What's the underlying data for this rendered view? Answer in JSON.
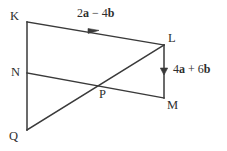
{
  "diagram": {
    "type": "vector-geometry-figure",
    "background_color": "#ffffff",
    "stroke_color": "#3a3a3a",
    "text_color": "#2e2e2e",
    "vertices": [
      {
        "id": "K",
        "label": "K",
        "x": 27,
        "y": 22
      },
      {
        "id": "L",
        "label": "L",
        "x": 164,
        "y": 45
      },
      {
        "id": "N",
        "label": "N",
        "x": 27,
        "y": 73
      },
      {
        "id": "M",
        "label": "M",
        "x": 164,
        "y": 98
      },
      {
        "id": "P",
        "label": "P",
        "x": 102,
        "y": 87
      },
      {
        "id": "Q",
        "label": "Q",
        "x": 27,
        "y": 130
      }
    ],
    "segments": [
      {
        "id": "KL",
        "from": "K",
        "to": "L",
        "arrow": "mid-forward"
      },
      {
        "id": "KQ",
        "from": "K",
        "to": "Q",
        "arrow": "none"
      },
      {
        "id": "LM",
        "from": "L",
        "to": "M",
        "arrow": "mid-down"
      },
      {
        "id": "NM",
        "from": "N",
        "to": "M",
        "arrow": "none"
      },
      {
        "id": "QL",
        "from": "Q",
        "to": "L",
        "arrow": "none"
      }
    ],
    "vector_labels": {
      "kl": {
        "coefficient_a": "2",
        "a": "a",
        "operator": " − ",
        "coefficient_b": "4",
        "b": "b"
      },
      "lm": {
        "coefficient_a": "4",
        "a": "a",
        "operator": " + ",
        "coefficient_b": "6",
        "b": "b"
      }
    }
  }
}
